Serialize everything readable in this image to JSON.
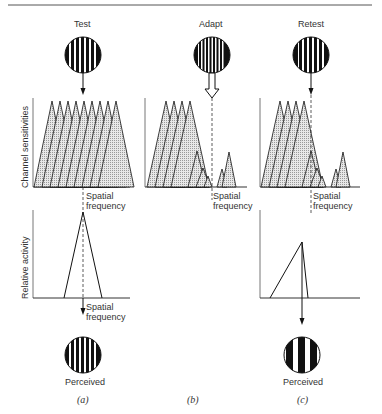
{
  "panels": [
    {
      "id": "a",
      "top_label": "Test",
      "grating": "medium",
      "channels_ylabel": "Channel sensitivities",
      "channels_xlabel_1": "Spatial",
      "channels_xlabel_2": "frequency",
      "activity_ylabel": "Relative activity",
      "activity_xlabel_1": "Spatial",
      "activity_xlabel_2": "frequency",
      "bottom_label": "Perceived",
      "caption": "(a)"
    },
    {
      "id": "b",
      "top_label": "Adapt",
      "grating": "fine",
      "channels_xlabel_1": "Spatial",
      "channels_xlabel_2": "frequency",
      "caption": "(b)"
    },
    {
      "id": "c",
      "top_label": "Retest",
      "grating": "medium",
      "channels_xlabel_1": "Spatial",
      "channels_xlabel_2": "frequency",
      "bottom_label": "Perceived",
      "caption": "(c)"
    }
  ],
  "colors": {
    "ink": "#1a1a1a",
    "fill": "#cfcfcf",
    "rule": "#555555"
  }
}
